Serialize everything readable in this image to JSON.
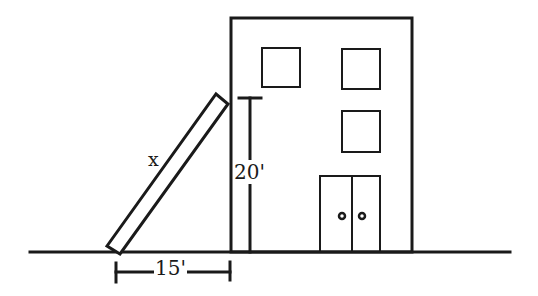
{
  "diagram": {
    "type": "ladder-against-building",
    "labels": {
      "ladder_length": "x",
      "height": "20'",
      "base_distance": "15'"
    },
    "colors": {
      "stroke": "#1a1a1a",
      "background": "#ffffff"
    },
    "elements": {
      "building": {
        "windows": 3,
        "doors": 2,
        "door_knobs": 2
      },
      "ground_line": true,
      "ladder": true,
      "height_marker": true,
      "distance_marker": true
    }
  }
}
